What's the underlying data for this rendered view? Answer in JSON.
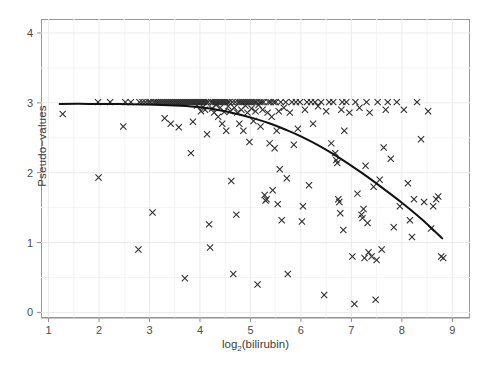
{
  "chart_data": {
    "type": "scatter",
    "title": "",
    "xlabel": "log2(bilirubin)",
    "xlabel_base": "log",
    "xlabel_sub": "2",
    "xlabel_rest": "(bilirubin)",
    "ylabel": "Pseudo−values",
    "xlim": [
      0.85,
      9.35
    ],
    "ylim": [
      -0.08,
      4.2
    ],
    "xticks": [
      1,
      2,
      3,
      4,
      5,
      6,
      7,
      8,
      9
    ],
    "yticks": [
      0,
      1,
      2,
      3,
      4
    ],
    "xticklabels": [
      "1",
      "2",
      "3",
      "4",
      "5",
      "6",
      "7",
      "8",
      "9"
    ],
    "yticklabels": [
      "0",
      "1",
      "2",
      "3",
      "4"
    ],
    "grid": true,
    "grid_minor": true,
    "grid_color": "#ebebeb",
    "grid_minor_color": "#f4f4f4",
    "marker": "x",
    "marker_color": "#2b2b2b",
    "marker_size": 3.1,
    "legend": null,
    "panel_border_color": "#9a9a9a",
    "line_color": "#111111",
    "line_width": 2.0,
    "series": [
      {
        "name": "Pseudo-values",
        "points": [
          [
            1.28,
            2.84
          ],
          [
            1.98,
            3.01
          ],
          [
            1.99,
            1.93
          ],
          [
            2.22,
            3.01
          ],
          [
            2.48,
            2.66
          ],
          [
            2.52,
            3.01
          ],
          [
            2.63,
            3.01
          ],
          [
            2.78,
            0.9
          ],
          [
            2.8,
            3.01
          ],
          [
            2.86,
            3.01
          ],
          [
            2.92,
            3.01
          ],
          [
            2.98,
            3.01
          ],
          [
            3.02,
            3.01
          ],
          [
            3.06,
            1.43
          ],
          [
            3.08,
            3.01
          ],
          [
            3.12,
            3.01
          ],
          [
            3.16,
            3.01
          ],
          [
            3.2,
            3.01
          ],
          [
            3.24,
            3.01
          ],
          [
            3.28,
            3.01
          ],
          [
            3.3,
            2.78
          ],
          [
            3.32,
            3.01
          ],
          [
            3.36,
            3.01
          ],
          [
            3.4,
            3.01
          ],
          [
            3.42,
            2.7
          ],
          [
            3.44,
            3.01
          ],
          [
            3.48,
            3.01
          ],
          [
            3.52,
            3.01
          ],
          [
            3.56,
            3.01
          ],
          [
            3.58,
            2.65
          ],
          [
            3.6,
            3.01
          ],
          [
            3.64,
            3.01
          ],
          [
            3.68,
            3.01
          ],
          [
            3.7,
            0.49
          ],
          [
            3.72,
            3.01
          ],
          [
            3.76,
            3.01
          ],
          [
            3.8,
            3.01
          ],
          [
            3.82,
            2.28
          ],
          [
            3.84,
            3.01
          ],
          [
            3.86,
            2.73
          ],
          [
            3.88,
            3.01
          ],
          [
            3.92,
            3.01
          ],
          [
            3.94,
            2.96
          ],
          [
            3.96,
            3.01
          ],
          [
            4.0,
            3.01
          ],
          [
            4.02,
            2.88
          ],
          [
            4.04,
            3.01
          ],
          [
            4.06,
            2.94
          ],
          [
            4.08,
            3.01
          ],
          [
            4.1,
            2.9
          ],
          [
            4.12,
            3.01
          ],
          [
            4.14,
            2.55
          ],
          [
            4.16,
            3.01
          ],
          [
            4.18,
            1.26
          ],
          [
            4.2,
            0.93
          ],
          [
            4.22,
            3.01
          ],
          [
            4.24,
            2.92
          ],
          [
            4.26,
            3.01
          ],
          [
            4.28,
            2.86
          ],
          [
            4.3,
            3.01
          ],
          [
            4.32,
            2.97
          ],
          [
            4.34,
            3.01
          ],
          [
            4.36,
            2.8
          ],
          [
            4.38,
            3.01
          ],
          [
            4.4,
            2.93
          ],
          [
            4.42,
            3.01
          ],
          [
            4.44,
            2.7
          ],
          [
            4.46,
            3.01
          ],
          [
            4.48,
            2.87
          ],
          [
            4.5,
            3.01
          ],
          [
            4.52,
            2.6
          ],
          [
            4.54,
            3.01
          ],
          [
            4.56,
            2.95
          ],
          [
            4.58,
            3.01
          ],
          [
            4.6,
            2.88
          ],
          [
            4.62,
            1.88
          ],
          [
            4.64,
            3.01
          ],
          [
            4.66,
            0.55
          ],
          [
            4.68,
            2.93
          ],
          [
            4.7,
            3.01
          ],
          [
            4.72,
            1.4
          ],
          [
            4.74,
            2.86
          ],
          [
            4.76,
            3.01
          ],
          [
            4.78,
            2.7
          ],
          [
            4.8,
            3.01
          ],
          [
            4.82,
            2.9
          ],
          [
            4.84,
            3.01
          ],
          [
            4.86,
            2.6
          ],
          [
            4.88,
            3.01
          ],
          [
            4.9,
            2.96
          ],
          [
            4.92,
            3.01
          ],
          [
            4.94,
            2.86
          ],
          [
            4.96,
            3.01
          ],
          [
            4.98,
            2.44
          ],
          [
            5.0,
            3.01
          ],
          [
            5.02,
            2.92
          ],
          [
            5.04,
            3.01
          ],
          [
            5.06,
            2.74
          ],
          [
            5.08,
            3.01
          ],
          [
            5.1,
            2.88
          ],
          [
            5.12,
            3.01
          ],
          [
            5.14,
            0.4
          ],
          [
            5.16,
            2.97
          ],
          [
            5.18,
            3.01
          ],
          [
            5.2,
            2.66
          ],
          [
            5.22,
            3.01
          ],
          [
            5.24,
            2.9
          ],
          [
            5.26,
            3.01
          ],
          [
            5.28,
            1.68
          ],
          [
            5.3,
            1.6
          ],
          [
            5.32,
            1.62
          ],
          [
            5.34,
            2.86
          ],
          [
            5.36,
            3.01
          ],
          [
            5.38,
            2.42
          ],
          [
            5.4,
            3.01
          ],
          [
            5.42,
            2.8
          ],
          [
            5.44,
            1.75
          ],
          [
            5.46,
            3.01
          ],
          [
            5.48,
            2.35
          ],
          [
            5.5,
            3.01
          ],
          [
            5.52,
            2.6
          ],
          [
            5.54,
            1.55
          ],
          [
            5.56,
            2.88
          ],
          [
            5.58,
            2.05
          ],
          [
            5.6,
            3.01
          ],
          [
            5.62,
            1.32
          ],
          [
            5.66,
            2.93
          ],
          [
            5.7,
            3.01
          ],
          [
            5.72,
            1.92
          ],
          [
            5.74,
            0.55
          ],
          [
            5.78,
            2.86
          ],
          [
            5.82,
            3.01
          ],
          [
            5.86,
            2.4
          ],
          [
            5.9,
            3.01
          ],
          [
            5.94,
            2.63
          ],
          [
            5.98,
            3.01
          ],
          [
            6.02,
            1.3
          ],
          [
            6.04,
            1.52
          ],
          [
            6.08,
            2.9
          ],
          [
            6.12,
            3.01
          ],
          [
            6.16,
            1.82
          ],
          [
            6.2,
            3.01
          ],
          [
            6.24,
            2.7
          ],
          [
            6.28,
            3.01
          ],
          [
            6.34,
            2.95
          ],
          [
            6.4,
            3.01
          ],
          [
            6.46,
            0.25
          ],
          [
            6.5,
            2.88
          ],
          [
            6.56,
            3.01
          ],
          [
            6.6,
            2.42
          ],
          [
            6.64,
            3.01
          ],
          [
            6.68,
            2.28
          ],
          [
            6.7,
            2.18
          ],
          [
            6.72,
            2.14
          ],
          [
            6.74,
            1.62
          ],
          [
            6.76,
            1.58
          ],
          [
            6.78,
            1.42
          ],
          [
            6.8,
            2.9
          ],
          [
            6.82,
            3.01
          ],
          [
            6.84,
            1.18
          ],
          [
            6.86,
            2.6
          ],
          [
            6.9,
            3.01
          ],
          [
            6.96,
            2.86
          ],
          [
            7.02,
            0.8
          ],
          [
            7.06,
            0.12
          ],
          [
            7.08,
            3.01
          ],
          [
            7.12,
            1.7
          ],
          [
            7.16,
            2.93
          ],
          [
            7.2,
            1.4
          ],
          [
            7.22,
            1.35
          ],
          [
            7.24,
            1.48
          ],
          [
            7.26,
            0.78
          ],
          [
            7.28,
            2.1
          ],
          [
            7.3,
            3.01
          ],
          [
            7.32,
            1.28
          ],
          [
            7.34,
            0.86
          ],
          [
            7.36,
            2.86
          ],
          [
            7.4,
            0.8
          ],
          [
            7.44,
            1.8
          ],
          [
            7.48,
            0.18
          ],
          [
            7.5,
            0.75
          ],
          [
            7.52,
            3.01
          ],
          [
            7.56,
            1.9
          ],
          [
            7.6,
            0.9
          ],
          [
            7.64,
            2.36
          ],
          [
            7.68,
            2.9
          ],
          [
            7.72,
            3.01
          ],
          [
            7.78,
            2.2
          ],
          [
            7.84,
            1.22
          ],
          [
            7.9,
            3.01
          ],
          [
            7.96,
            1.52
          ],
          [
            8.04,
            2.9
          ],
          [
            8.12,
            1.85
          ],
          [
            8.16,
            1.32
          ],
          [
            8.2,
            1.08
          ],
          [
            8.24,
            1.62
          ],
          [
            8.3,
            3.01
          ],
          [
            8.38,
            2.48
          ],
          [
            8.44,
            1.58
          ],
          [
            8.52,
            2.88
          ],
          [
            8.58,
            1.2
          ],
          [
            8.62,
            1.52
          ],
          [
            8.68,
            1.62
          ],
          [
            8.72,
            1.66
          ],
          [
            8.78,
            0.8
          ],
          [
            8.82,
            0.78
          ]
        ]
      }
    ],
    "trend_line": {
      "name": "smoothed fit",
      "points": [
        [
          1.22,
          2.985
        ],
        [
          1.8,
          2.985
        ],
        [
          2.4,
          2.982
        ],
        [
          3.0,
          2.975
        ],
        [
          3.5,
          2.962
        ],
        [
          3.9,
          2.945
        ],
        [
          4.2,
          2.92
        ],
        [
          4.5,
          2.88
        ],
        [
          4.8,
          2.83
        ],
        [
          5.1,
          2.77
        ],
        [
          5.4,
          2.7
        ],
        [
          5.7,
          2.615
        ],
        [
          6.0,
          2.52
        ],
        [
          6.4,
          2.37
        ],
        [
          6.8,
          2.195
        ],
        [
          7.2,
          2.0
        ],
        [
          7.6,
          1.79
        ],
        [
          8.0,
          1.57
        ],
        [
          8.4,
          1.33
        ],
        [
          8.8,
          1.06
        ]
      ]
    }
  }
}
